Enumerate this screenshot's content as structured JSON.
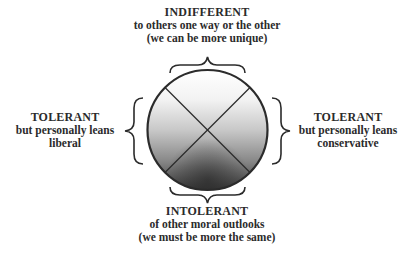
{
  "diagram": {
    "top": {
      "title": "INDIFFERENT",
      "line1": "to others one way or the other",
      "line2": "(we can be more unique)"
    },
    "left": {
      "title": "TOLERANT",
      "line1": "but personally leans",
      "line2": "liberal"
    },
    "right": {
      "title": "TOLERANT",
      "line1": "but personally leans",
      "line2": "conservative"
    },
    "bottom": {
      "title": "INTOLERANT",
      "line1": "of other moral outlooks",
      "line2": "(we must be more the same)"
    },
    "circle": {
      "gradient_top_color": "#ffffff",
      "gradient_bottom_color": "#3a3a3a",
      "stroke_color": "#2b2b2b"
    }
  }
}
